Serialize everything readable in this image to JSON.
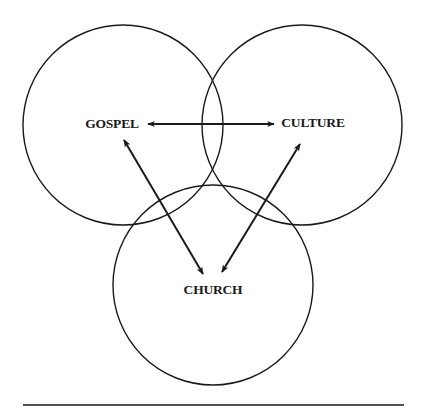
{
  "diagram": {
    "nodes": [
      {
        "id": "gospel",
        "label": "GOSPEL",
        "circle": {
          "cx": 123,
          "cy": 125,
          "r": 100
        },
        "label_pos": {
          "x": 112,
          "y": 124
        }
      },
      {
        "id": "culture",
        "label": "CULTURE",
        "circle": {
          "cx": 302,
          "cy": 125,
          "r": 100
        },
        "label_pos": {
          "x": 313,
          "y": 123
        }
      },
      {
        "id": "church",
        "label": "CHURCH",
        "circle": {
          "cx": 213,
          "cy": 285,
          "r": 100
        },
        "label_pos": {
          "x": 213,
          "y": 290
        }
      }
    ],
    "edges": [
      {
        "from": "gospel",
        "to": "culture",
        "direction": "both"
      },
      {
        "from": "gospel",
        "to": "church",
        "direction": "both"
      },
      {
        "from": "culture",
        "to": "church",
        "direction": "both"
      }
    ],
    "stroke_color": "#1a1a1a",
    "footer_rule": {
      "x1": 23,
      "x2": 404,
      "y": 405
    }
  }
}
